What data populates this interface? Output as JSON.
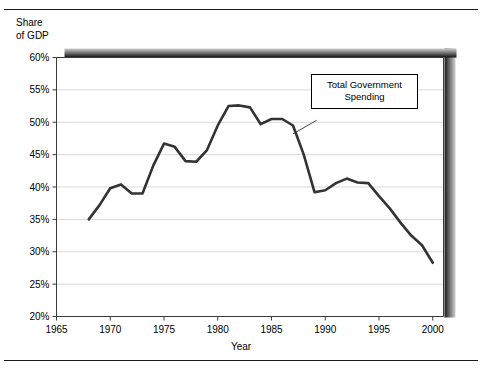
{
  "figure": {
    "rule_top_name": "top-divider",
    "rule_bottom_name": "bottom-divider"
  },
  "chart_data": {
    "type": "line",
    "title": "",
    "subtitle": "",
    "xlabel": "Year",
    "ylabel": "Share\nof GDP",
    "ylabel_lines": [
      "Share",
      "of GDP"
    ],
    "xlim": [
      1965,
      2001
    ],
    "ylim": [
      20,
      60
    ],
    "y_tick_values": [
      20,
      25,
      30,
      35,
      40,
      45,
      50,
      55,
      60
    ],
    "y_tick_labels": [
      "20%",
      "25%",
      "30%",
      "35%",
      "40%",
      "45%",
      "50%",
      "55%",
      "60%"
    ],
    "x_tick_values": [
      1965,
      1970,
      1975,
      1980,
      1985,
      1990,
      1995,
      2000
    ],
    "x_tick_labels": [
      "1965",
      "1970",
      "1975",
      "1980",
      "1985",
      "1990",
      "1995",
      "2000"
    ],
    "grid": "horizontal",
    "grid_color": "#d9d9d9",
    "legend": "none",
    "line_color": "#333333",
    "line_width": 2.6,
    "series": [
      {
        "name": "Total Government Spending",
        "x": [
          1968,
          1969,
          1970,
          1971,
          1972,
          1973,
          1974,
          1975,
          1976,
          1977,
          1978,
          1979,
          1980,
          1981,
          1982,
          1983,
          1984,
          1985,
          1986,
          1987,
          1988,
          1989,
          1990,
          1991,
          1992,
          1993,
          1994,
          1995,
          1996,
          1997,
          1998,
          1999,
          2000
        ],
        "values": [
          35.0,
          37.2,
          39.8,
          40.4,
          39.0,
          39.0,
          43.3,
          46.7,
          46.2,
          44.0,
          43.9,
          45.7,
          49.5,
          52.5,
          52.6,
          52.3,
          49.7,
          50.5,
          50.5,
          49.5,
          45.0,
          39.2,
          39.5,
          40.6,
          41.3,
          40.7,
          40.6,
          38.6,
          36.7,
          34.5,
          32.5,
          31.0,
          28.3
        ]
      }
    ],
    "annotations": [
      {
        "name": "total-government-spending-callout",
        "text": "Total Government\nSpending",
        "lines": [
          "Total Government",
          "Spending"
        ],
        "leader_from": [
          1987.0,
          48.2
        ],
        "leader_to": [
          1989.2,
          50.3
        ]
      }
    ]
  },
  "axis_title_x": "Year"
}
